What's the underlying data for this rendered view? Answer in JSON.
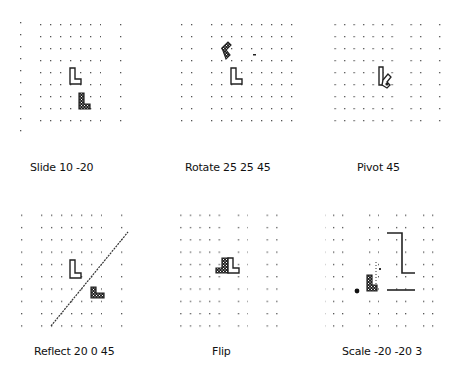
{
  "figure": {
    "panels": [
      {
        "id": "slide",
        "caption": "Slide 10 -20",
        "command": "Slide",
        "args": [
          10,
          -20
        ]
      },
      {
        "id": "rotate",
        "caption": "Rotate 25 25 45",
        "command": "Rotate",
        "args": [
          25,
          25,
          45
        ]
      },
      {
        "id": "pivot",
        "caption": "Pivot 45",
        "command": "Pivot",
        "args": [
          45
        ]
      },
      {
        "id": "reflect",
        "caption": "Reflect 20 0 45",
        "command": "Reflect",
        "args": [
          20,
          0,
          45
        ]
      },
      {
        "id": "flip",
        "caption": "Flip",
        "command": "Flip",
        "args": []
      },
      {
        "id": "scale",
        "caption": "Scale -20 -20 3",
        "command": "Scale",
        "args": [
          -20,
          -20,
          3
        ]
      }
    ],
    "colors": {
      "background": "#ffffff",
      "grid_dot": "#555555",
      "outline": "#222222",
      "ink": "#111111"
    }
  }
}
